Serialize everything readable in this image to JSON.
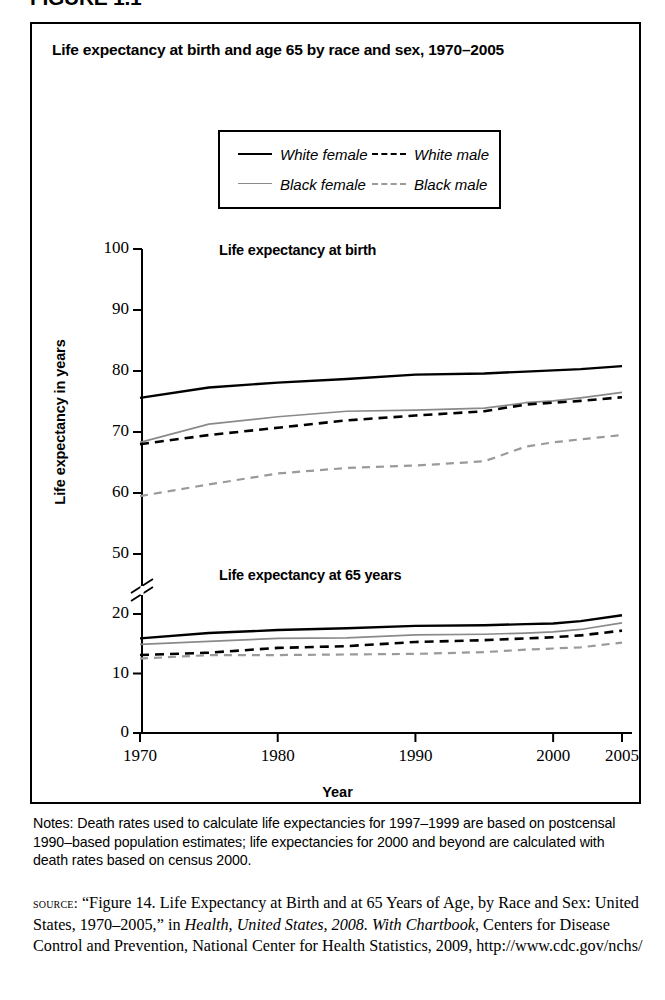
{
  "figure": {
    "label": "FIGURE 1.1"
  },
  "chart": {
    "title": "Life expectancy at birth and age 65 by race and sex, 1970–2005",
    "panel_captions": {
      "birth": "Life expectancy at birth",
      "age65": "Life expectancy at 65 years"
    },
    "axis_titles": {
      "x": "Year",
      "y": "Life expectancy in years"
    }
  },
  "legend": {
    "entries": [
      {
        "label": "White female",
        "style": "sw-solid-dark",
        "color": "#000000",
        "dash": "solid",
        "row": 0,
        "col": 0
      },
      {
        "label": "White male",
        "style": "sw-dash-dark",
        "color": "#000000",
        "dash": "dashed",
        "row": 0,
        "col": 1
      },
      {
        "label": "Black female",
        "style": "sw-solid-gray",
        "color": "#8a8a8a",
        "dash": "solid",
        "row": 1,
        "col": 0
      },
      {
        "label": "Black male",
        "style": "sw-dash-gray",
        "color": "#9a9a9a",
        "dash": "dashed",
        "row": 1,
        "col": 1
      }
    ]
  },
  "notes": {
    "text": "Notes: Death rates used to calculate life expectancies for 1997–1999 are based on postcensal 1990–based population estimates; life expectancies for 2000 and beyond are calculated with death rates based on census 2000."
  },
  "source": {
    "kicker": "source:",
    "part1": " “Figure 14. Life Expectancy at Birth and at 65 Years of Age, by Race and Sex: United States, 1970–2005,” in ",
    "italic1": "Health, United States, 2008. With Chartbook",
    "part2": ", Centers for Disease Control and Prevention, National Center for Health Statistics, 2009, http://www.cdc.gov/nchs/"
  },
  "chart_data": {
    "type": "line",
    "title": "Life expectancy at birth and age 65 by race and sex, 1970–2005",
    "xlabel": "Year",
    "ylabel": "Life expectancy in years",
    "grid": false,
    "legend_position": "top-center",
    "axis_break": {
      "between": [
        20,
        50
      ],
      "note": "y-axis broken between 20 and 50"
    },
    "yticks_upper": [
      50,
      60,
      70,
      80,
      90,
      100
    ],
    "yticks_lower": [
      0,
      10,
      20
    ],
    "xticks": [
      1970,
      1980,
      1990,
      2000,
      2005
    ],
    "xlim": [
      1970,
      2005
    ],
    "panels": [
      {
        "name": "Life expectancy at birth",
        "ylim": [
          50,
          100
        ],
        "x": [
          1970,
          1975,
          1980,
          1985,
          1990,
          1995,
          1998,
          2000,
          2002,
          2005
        ],
        "series": [
          {
            "name": "White female",
            "color": "#000000",
            "dash": "solid",
            "values": [
              75.6,
              77.3,
              78.1,
              78.7,
              79.4,
              79.6,
              79.9,
              80.1,
              80.3,
              80.8
            ]
          },
          {
            "name": "Black female",
            "color": "#8a8a8a",
            "dash": "solid",
            "values": [
              68.3,
              71.3,
              72.5,
              73.4,
              73.6,
              73.9,
              74.8,
              75.1,
              75.6,
              76.5
            ]
          },
          {
            "name": "White male",
            "color": "#000000",
            "dash": "dashed",
            "values": [
              68.0,
              69.5,
              70.7,
              71.9,
              72.7,
              73.4,
              74.5,
              74.8,
              75.1,
              75.7
            ]
          },
          {
            "name": "Black male",
            "color": "#9a9a9a",
            "dash": "dashed",
            "values": [
              59.5,
              61.4,
              63.2,
              64.1,
              64.5,
              65.2,
              67.6,
              68.3,
              68.8,
              69.5
            ]
          }
        ]
      },
      {
        "name": "Life expectancy at 65 years",
        "ylim": [
          0,
          20
        ],
        "x": [
          1970,
          1975,
          1980,
          1985,
          1990,
          1995,
          1998,
          2000,
          2002,
          2005
        ],
        "series": [
          {
            "name": "White female",
            "color": "#000000",
            "dash": "solid",
            "values": [
              15.9,
              16.8,
              17.3,
              17.6,
              18.0,
              18.1,
              18.3,
              18.4,
              18.8,
              19.8
            ]
          },
          {
            "name": "Black female",
            "color": "#8a8a8a",
            "dash": "solid",
            "values": [
              14.9,
              15.4,
              15.9,
              16.0,
              16.5,
              16.6,
              16.8,
              17.0,
              17.4,
              18.5
            ]
          },
          {
            "name": "White male",
            "color": "#000000",
            "dash": "dashed",
            "values": [
              13.1,
              13.5,
              14.3,
              14.6,
              15.3,
              15.6,
              15.9,
              16.1,
              16.4,
              17.2
            ]
          },
          {
            "name": "Black male",
            "color": "#9a9a9a",
            "dash": "dashed",
            "values": [
              12.5,
              13.1,
              13.1,
              13.2,
              13.3,
              13.6,
              14.0,
              14.2,
              14.4,
              15.2
            ]
          }
        ]
      }
    ]
  },
  "geometry": {
    "plot_left": 110,
    "plot_right": 600,
    "x_at_1970": 108,
    "x_at_2005": 590,
    "upper": {
      "y_top_px": 225,
      "y_bottom_px": 530,
      "v_top": 100,
      "v_bottom": 50
    },
    "lower": {
      "y_top_px": 590,
      "y_bottom_px": 709,
      "v_top": 20,
      "v_bottom": 0
    },
    "break_y": 563
  }
}
